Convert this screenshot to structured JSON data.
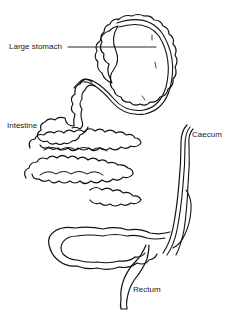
{
  "diagram": {
    "labels": [
      {
        "id": "large-stomach",
        "text": "Large stomach"
      },
      {
        "id": "intestine",
        "text": "Intestine"
      },
      {
        "id": "caecum",
        "text": "Caecum"
      },
      {
        "id": "rectum",
        "text": "Rectum"
      }
    ],
    "colors": {
      "line": "#111111",
      "background": "#ffffff"
    }
  }
}
